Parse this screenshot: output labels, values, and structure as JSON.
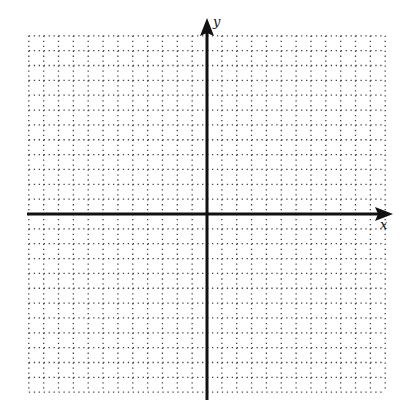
{
  "chart_data": {
    "type": "scatter",
    "title": "",
    "xlabel": "x",
    "ylabel": "y",
    "xlim": [
      -12,
      12
    ],
    "ylim": [
      -12,
      12
    ],
    "grid": true,
    "grid_style": "dotted",
    "tick_labels": false,
    "series": []
  },
  "axes": {
    "x_label": "x",
    "y_label": "y"
  },
  "colors": {
    "axis": "#111111",
    "grid": "#444444",
    "background": "#ffffff"
  }
}
